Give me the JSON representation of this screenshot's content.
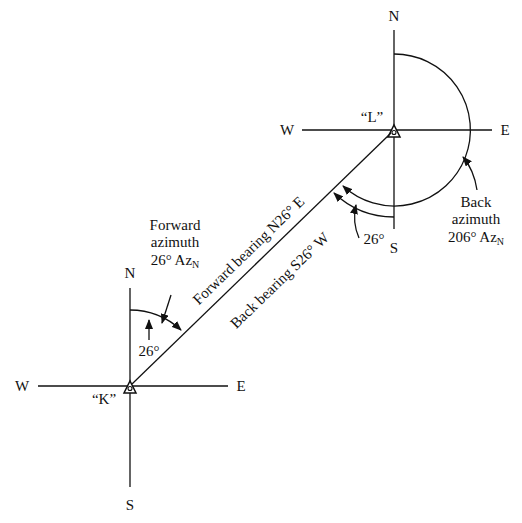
{
  "diagram": {
    "type": "bearing-azimuth-diagram",
    "colors": {
      "ink": "#111111",
      "background": "#ffffff"
    },
    "stations": [
      {
        "id": "K",
        "label": "“K”",
        "compass": {
          "north": "N",
          "south": "S",
          "east": "E",
          "west": "W"
        }
      },
      {
        "id": "L",
        "label": "“L”",
        "compass": {
          "north": "N",
          "south": "S",
          "east": "E",
          "west": "W"
        }
      }
    ],
    "line_labels": {
      "forward_bearing": "Forward bearing N26° E",
      "back_bearing": "Back bearing S26° W"
    },
    "forward_azimuth": {
      "line1": "Forward",
      "line2": "azimuth",
      "value": "26° Az",
      "subscript": "N",
      "angle_label": "26°"
    },
    "back_azimuth": {
      "line1": "Back",
      "line2": "azimuth",
      "value": "206° Az",
      "subscript": "N",
      "angle_label": "26°"
    }
  }
}
